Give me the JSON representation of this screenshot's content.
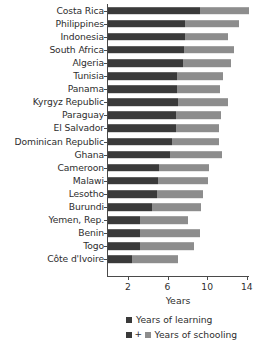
{
  "chart_data": {
    "type": "bar",
    "orientation": "horizontal",
    "stacked": true,
    "title": "",
    "xlabel": "Years",
    "ylabel": "",
    "xlim": [
      0,
      14.8
    ],
    "xticks": [
      2,
      6,
      10,
      14
    ],
    "xtick_labels": [
      "2",
      "6",
      "10",
      "14"
    ],
    "grid": false,
    "legend_position": "bottom",
    "categories": [
      "Costa Rica",
      "Philippines",
      "Indonesia",
      "South Africa",
      "Algeria",
      "Tunisia",
      "Panama",
      "Kyrgyz Republic",
      "Paraguay",
      "El Salvador",
      "Dominican Republic",
      "Ghana",
      "Cameroon",
      "Malawi",
      "Lesotho",
      "Burundi",
      "Yemen, Rep.",
      "Benin",
      "Togo",
      "Côte d'Ivoire"
    ],
    "series": [
      {
        "name": "Years of learning",
        "color": "#3a3a3a",
        "values": [
          9.3,
          7.8,
          7.8,
          7.7,
          7.6,
          7.0,
          7.0,
          7.1,
          6.9,
          6.9,
          6.5,
          6.2,
          5.1,
          5.0,
          4.9,
          4.4,
          3.2,
          3.2,
          3.2,
          2.4
        ]
      },
      {
        "name": "Years of schooling",
        "color": "#8d8d8d",
        "values": [
          4.9,
          5.4,
          4.3,
          5.0,
          4.8,
          4.6,
          4.3,
          5.0,
          4.5,
          4.3,
          4.7,
          5.3,
          5.1,
          5.1,
          4.7,
          5.0,
          4.9,
          6.1,
          5.5,
          4.7
        ]
      }
    ],
    "legend": [
      {
        "label": "Years of learning",
        "style": "single",
        "swatches": [
          "#3a3a3a"
        ]
      },
      {
        "label": "Years of schooling",
        "style": "sum",
        "swatches": [
          "#3a3a3a",
          "#8d8d8d"
        ],
        "connector": "+"
      }
    ]
  }
}
